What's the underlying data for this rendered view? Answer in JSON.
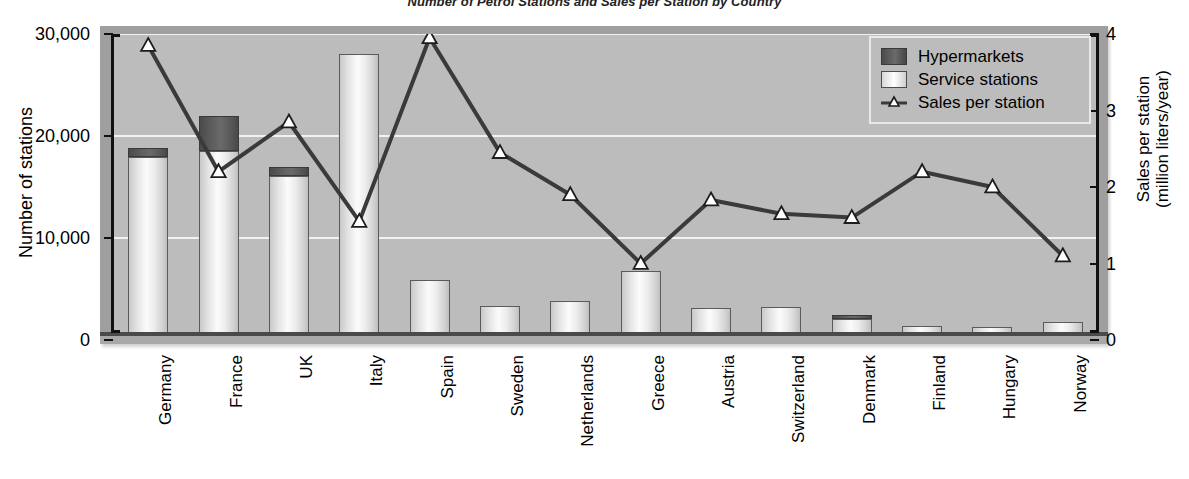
{
  "chart_data": {
    "type": "bar",
    "title": "Number of Petrol Stations and Sales per Station by Country",
    "xlabel": "",
    "ylabel": "Number of stations",
    "y2label_line1": "Sales per station",
    "y2label_line2": "(million liters/year)",
    "ylim": [
      0,
      30000
    ],
    "y2lim": [
      0,
      4
    ],
    "yticks": [
      "0",
      "10,000",
      "20,000",
      "30,000"
    ],
    "ytick_values": [
      0,
      10000,
      20000,
      30000
    ],
    "y2ticks": [
      "0",
      "1",
      "2",
      "3",
      "4"
    ],
    "y2tick_values": [
      0,
      1,
      2,
      3,
      4
    ],
    "grid": true,
    "legend_position": "top-right",
    "categories": [
      "Germany",
      "France",
      "UK",
      "Italy",
      "Spain",
      "Sweden",
      "Netherlands",
      "Greece",
      "Austria",
      "Switzerland",
      "Denmark",
      "Finland",
      "Hungary",
      "Norway"
    ],
    "series": [
      {
        "name": "Service stations",
        "type": "bar-stacked",
        "color": "#f0f0f0",
        "values": [
          17900,
          18500,
          16100,
          28000,
          5900,
          3300,
          3800,
          6800,
          3150,
          3250,
          2100,
          1350,
          1250,
          1750
        ]
      },
      {
        "name": "Hypermarkets",
        "type": "bar-stacked",
        "color": "#555555",
        "values": [
          900,
          3500,
          900,
          0,
          0,
          0,
          0,
          0,
          0,
          0,
          350,
          0,
          0,
          0
        ]
      },
      {
        "name": "Sales per station",
        "type": "line",
        "axis": "right",
        "color": "#3a3a3a",
        "marker": "triangle-up",
        "values": [
          3.85,
          2.2,
          2.85,
          1.55,
          3.95,
          2.45,
          1.9,
          1.0,
          1.83,
          1.65,
          1.6,
          2.2,
          2.0,
          1.1
        ]
      }
    ],
    "totals": [
      18800,
      22000,
      17000,
      28000,
      5900,
      3300,
      3800,
      6800,
      3150,
      3250,
      2450,
      1350,
      1250,
      1750
    ]
  },
  "legend": {
    "items": [
      {
        "label": "Hypermarkets",
        "swatch": "dark-square"
      },
      {
        "label": "Service stations",
        "swatch": "light-square"
      },
      {
        "label": "Sales per station",
        "swatch": "line-with-triangle-marker"
      }
    ]
  },
  "colors": {
    "plot_background": "#bcbcbc",
    "panel_frame": "#9f9f9f",
    "gridline": "#f2f2f2",
    "hypermarket": "#555555",
    "service_station": "#f0f0f0",
    "line": "#3a3a3a",
    "axis": "#111111"
  }
}
